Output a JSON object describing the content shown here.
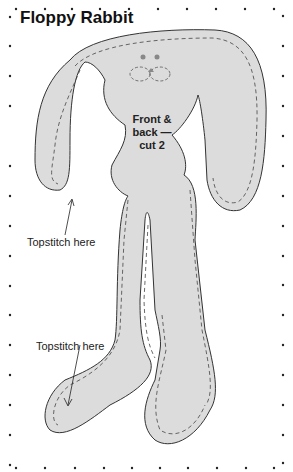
{
  "title": "Floppy Rabbit",
  "piece_label": [
    "Front &",
    "back —",
    "cut 2"
  ],
  "annotations": {
    "ear_topstitch": "Topstitch here",
    "foot_topstitch": "Topstitch here"
  },
  "colors": {
    "fabric_fill": "#dcdcdc",
    "outline": "#333333",
    "background": "#ffffff"
  }
}
